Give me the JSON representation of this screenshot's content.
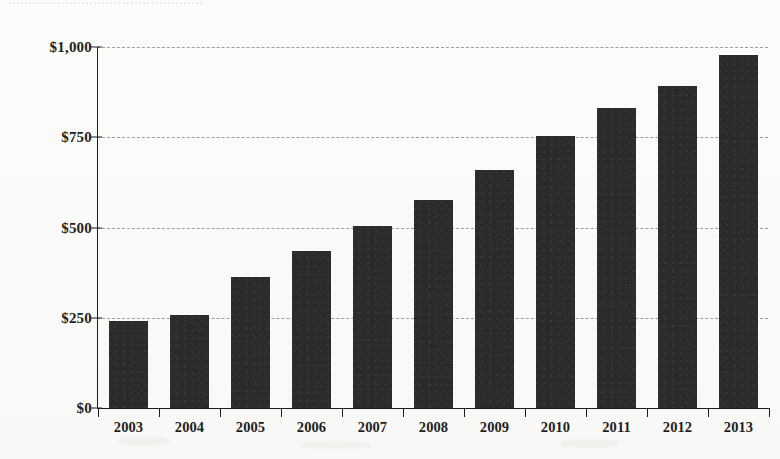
{
  "caption": {
    "clipped_top_text": "…………………………………………"
  },
  "chart_data": {
    "type": "bar",
    "title": "",
    "subtitle": "",
    "xlabel": "",
    "ylabel": "",
    "categories": [
      "2003",
      "2004",
      "2005",
      "2006",
      "2007",
      "2008",
      "2009",
      "2010",
      "2011",
      "2012",
      "2013"
    ],
    "values": [
      240,
      258,
      362,
      435,
      503,
      575,
      658,
      753,
      830,
      892,
      978
    ],
    "value_prefix": "$",
    "ylim": [
      0,
      1000
    ],
    "y_ticks": [
      0,
      250,
      500,
      750,
      1000
    ],
    "y_tick_labels": [
      "$0",
      "$250",
      "$500",
      "$750",
      "$1,000"
    ],
    "grid": true,
    "grid_style": "dashed-horizontal",
    "legend": null,
    "legend_position": "none",
    "series": [
      {
        "name": "",
        "values": [
          240,
          258,
          362,
          435,
          503,
          575,
          658,
          753,
          830,
          892,
          978
        ]
      }
    ]
  },
  "style": {
    "bar_color": "#2b2b2b",
    "axis_color": "#1d1d1d",
    "grid_color": "#8d8d8d",
    "background": "#fbfbfa",
    "text_color": "#1f1f1f"
  }
}
